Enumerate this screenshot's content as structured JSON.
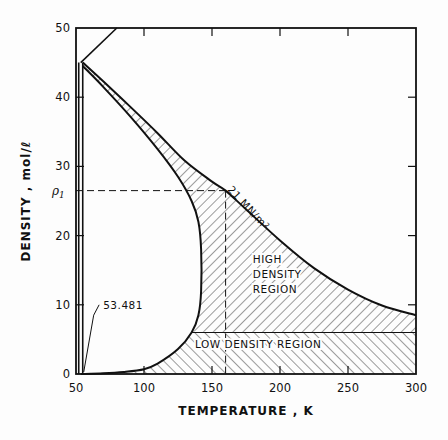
{
  "chart_data": {
    "type": "line",
    "title": "",
    "xlabel": "TEMPERATURE , K",
    "ylabel": "DENSITY , mol/ℓ",
    "xlim": [
      50,
      300
    ],
    "ylim": [
      0,
      50
    ],
    "x_ticks": [
      50,
      100,
      150,
      200,
      250,
      300
    ],
    "y_ticks": [
      0,
      10,
      20,
      30,
      40,
      50
    ],
    "x_tick_labels": [
      "50",
      "100",
      "150",
      "200",
      "250",
      "300"
    ],
    "y_tick_labels": [
      "0",
      "10",
      "20",
      "30",
      "40",
      "50"
    ],
    "grid": false,
    "series": [
      {
        "name": "21 MN/m² isobar",
        "x": [
          55,
          70,
          90,
          110,
          130,
          150,
          160,
          175,
          200,
          225,
          250,
          275,
          300
        ],
        "y": [
          45,
          42.3,
          38.6,
          34.8,
          30.8,
          27.8,
          26.5,
          23.8,
          19.3,
          15.3,
          12.2,
          9.9,
          8.5
        ]
      },
      {
        "name": "phase boundary",
        "x": [
          55,
          70,
          90,
          110,
          125,
          135,
          140,
          142,
          142,
          140,
          135,
          125,
          110,
          100,
          85,
          70,
          53.481
        ],
        "y": [
          44.5,
          41.5,
          37.2,
          32.5,
          28.5,
          25,
          22,
          18,
          12,
          8.5,
          6,
          3.6,
          1.5,
          0.7,
          0.3,
          0.1,
          0
        ]
      },
      {
        "name": "melting line",
        "x": [
          53.481,
          53.481,
          80
        ],
        "y": [
          0,
          45,
          50
        ]
      }
    ],
    "reference_lines": [
      {
        "type": "horizontal",
        "y": 26.5,
        "label": "ρ1",
        "style": "dashed",
        "x_range": [
          50,
          160
        ]
      },
      {
        "type": "vertical",
        "x": 160,
        "style": "dashed",
        "y_range": [
          0,
          26.5
        ]
      }
    ],
    "regions": [
      {
        "name": "HIGH DENSITY REGION",
        "lines": [
          "HIGH",
          "DENSITY",
          "REGION"
        ],
        "y_range": [
          6,
          "isobar"
        ],
        "hatch": "forward"
      },
      {
        "name": "LOW DENSITY REGION",
        "y_range": [
          0,
          6
        ],
        "hatch": "backward"
      }
    ],
    "low_density_boundary": 6,
    "annotations": [
      {
        "text": "53.481",
        "x": 53.481,
        "y": 0
      },
      {
        "text": "21 MN/m²",
        "along": "isobar",
        "x": 165,
        "y": 24
      }
    ],
    "legend": "none"
  },
  "labels": {
    "rho1": "ρ",
    "rho1_sub": "1",
    "triple_point": "53.481",
    "isobar": "21 MN/m²",
    "high_region": [
      "HIGH",
      "DENSITY",
      "REGION"
    ],
    "low_region": "LOW DENSITY REGION",
    "xlabel": "TEMPERATURE , K",
    "ylabel": "DENSITY , mol/ℓ"
  }
}
